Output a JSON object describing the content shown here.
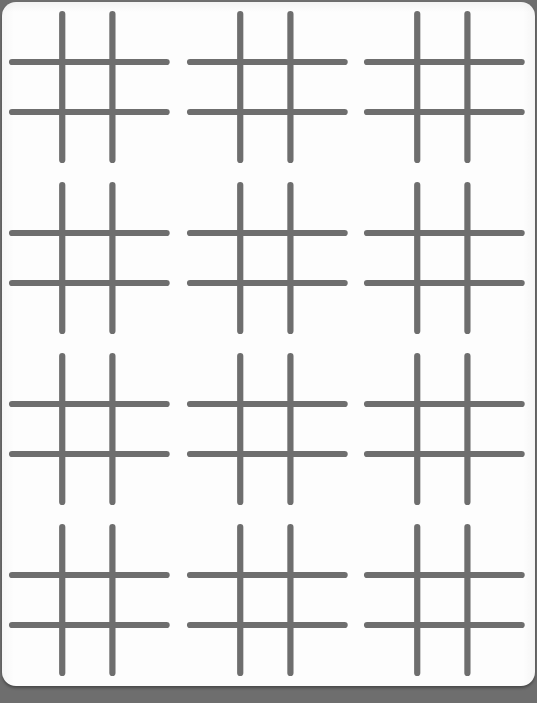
{
  "document": {
    "title": "Hash Grid Worksheet",
    "kind": "printed-sheet",
    "page_background_color": "#6e6e6e",
    "sheet_background_color": "#fdfdfd",
    "sheet_corner_radius_px": 14
  },
  "grid": {
    "columns": 3,
    "rows": 4,
    "total_figures": 12,
    "figure_name": "hash-symbol",
    "figure_description": "tic-tac-toe style hash made of two vertical and two horizontal strokes",
    "stroke_color": "#6e6e6e",
    "stroke_width_px": 6.2,
    "stroke_linecap": "round",
    "cell_width_px": 177,
    "cell_height_px": 171
  },
  "figure_geometry": {
    "viewbox": "0 0 177 171",
    "vertical_lines": [
      {
        "x": 60,
        "y1": 12,
        "y2": 158
      },
      {
        "x": 110,
        "y1": 12,
        "y2": 158
      }
    ],
    "horizontal_lines": [
      {
        "y": 60,
        "x1": 10,
        "x2": 164
      },
      {
        "y": 110,
        "x1": 10,
        "x2": 164
      }
    ]
  },
  "figures": [
    {
      "id": "hash-r1-c1",
      "row": 1,
      "col": 1,
      "label": "hash 1"
    },
    {
      "id": "hash-r1-c2",
      "row": 1,
      "col": 2,
      "label": "hash 2"
    },
    {
      "id": "hash-r1-c3",
      "row": 1,
      "col": 3,
      "label": "hash 3"
    },
    {
      "id": "hash-r2-c1",
      "row": 2,
      "col": 1,
      "label": "hash 4"
    },
    {
      "id": "hash-r2-c2",
      "row": 2,
      "col": 2,
      "label": "hash 5"
    },
    {
      "id": "hash-r2-c3",
      "row": 2,
      "col": 3,
      "label": "hash 6"
    },
    {
      "id": "hash-r3-c1",
      "row": 3,
      "col": 1,
      "label": "hash 7"
    },
    {
      "id": "hash-r3-c2",
      "row": 3,
      "col": 2,
      "label": "hash 8"
    },
    {
      "id": "hash-r3-c3",
      "row": 3,
      "col": 3,
      "label": "hash 9"
    },
    {
      "id": "hash-r4-c1",
      "row": 4,
      "col": 1,
      "label": "hash 10"
    },
    {
      "id": "hash-r4-c2",
      "row": 4,
      "col": 2,
      "label": "hash 11"
    },
    {
      "id": "hash-r4-c3",
      "row": 4,
      "col": 3,
      "label": "hash 12"
    }
  ]
}
